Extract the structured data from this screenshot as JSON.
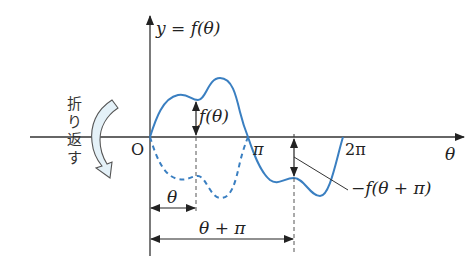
{
  "diagram": {
    "title_label": "y = f(θ)",
    "origin_label": "O",
    "x_axis_label": "θ",
    "tick_labels": {
      "pi": "π",
      "two_pi": "2π"
    },
    "value_label_positive": "f(θ)",
    "value_label_negative": "−f(θ + π)",
    "distance_labels": {
      "theta": "θ",
      "theta_plus_pi": "θ + π"
    },
    "fold_text": [
      "折",
      "り",
      "返",
      "す"
    ],
    "colors": {
      "curve": "#3a7fc1",
      "axis": "#333333",
      "fold_arrow_fill": "#e4f1f8",
      "fold_arrow_stroke": "#555555"
    }
  }
}
